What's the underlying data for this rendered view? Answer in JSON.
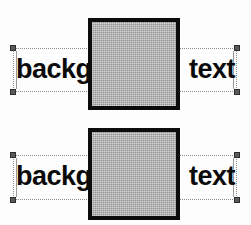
{
  "canvas": {
    "width": 251,
    "height": 225,
    "background_color": "#fdfdfd"
  },
  "colors": {
    "text": "#0a0a0a",
    "shape_fill": "#a9a9a9",
    "shape_border": "#0c0c0c",
    "selection_border": "#8e8e8e",
    "handle_fill": "#5a5a5a",
    "handle_border": "#2e2e2e"
  },
  "rows": [
    {
      "name": "first-selection-row",
      "top": 0,
      "selection": {
        "left": 13,
        "top": 48,
        "width": 224,
        "height": 44
      },
      "text_left": {
        "value": "backg",
        "top": 54
      },
      "text_right": {
        "value": "text",
        "top": 54
      },
      "shape": {
        "name": "gray-square",
        "left": 88,
        "top": 18,
        "width": 92,
        "height": 92
      }
    },
    {
      "name": "second-selection-row",
      "top": 110,
      "selection": {
        "left": 13,
        "top": 45,
        "width": 224,
        "height": 45
      },
      "text_left": {
        "value": "backg",
        "top": 51
      },
      "text_right": {
        "value": "text",
        "top": 51
      },
      "shape": {
        "name": "gray-square",
        "left": 88,
        "top": 18,
        "width": 92,
        "height": 92
      }
    }
  ]
}
